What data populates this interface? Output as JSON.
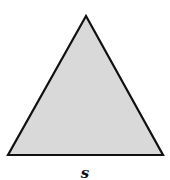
{
  "figure": {
    "shape": "equilateral-triangle",
    "fill_color": "#d9d9d9",
    "stroke_color": "#111111",
    "side_label": "s"
  }
}
